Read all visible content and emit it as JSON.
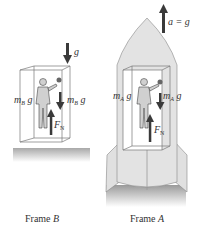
{
  "frame_b": {
    "caption_prefix": "Frame ",
    "caption_var": "B",
    "gravity_label": "g",
    "person_weight": "m",
    "person_weight_sub": "B",
    "person_weight_suffix": " g",
    "ball_weight": "m",
    "ball_weight_sub": "B",
    "ball_weight_suffix": " g",
    "normal_force": "F",
    "normal_force_sub": "N"
  },
  "frame_a": {
    "caption_prefix": "Frame ",
    "caption_var": "A",
    "accel_label": "a = g",
    "person_weight": "m",
    "person_weight_sub": "A",
    "person_weight_suffix": " g",
    "ball_weight": "m",
    "ball_weight_sub": "A",
    "ball_weight_suffix": " g",
    "normal_force": "F",
    "normal_force_sub": "N"
  },
  "colors": {
    "arrow": "#3a3a3a",
    "rocket_fill": "#e3e3e3",
    "ground": "#b8b8b8"
  }
}
